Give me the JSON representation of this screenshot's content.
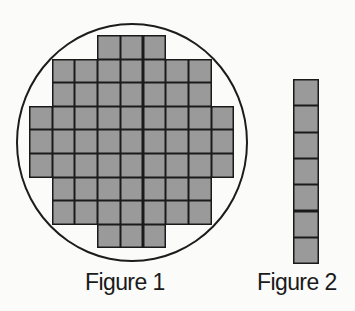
{
  "figure1": {
    "caption": "Figure 1",
    "shape": "circle",
    "grid": {
      "origin_x": 29,
      "origin_y": 35,
      "cell_w": 22.7,
      "cell_h": 23.6,
      "rows": [
        {
          "start_col": 3,
          "count": 3
        },
        {
          "start_col": 1,
          "count": 7
        },
        {
          "start_col": 1,
          "count": 7
        },
        {
          "start_col": 0,
          "count": 9
        },
        {
          "start_col": 0,
          "count": 9
        },
        {
          "start_col": 0,
          "count": 9
        },
        {
          "start_col": 1,
          "count": 7
        },
        {
          "start_col": 1,
          "count": 7
        },
        {
          "start_col": 3,
          "count": 3
        }
      ],
      "total_squares": 57
    }
  },
  "figure2": {
    "caption": "Figure 2",
    "column": {
      "origin_x": 293,
      "origin_y": 79,
      "cell_w": 26,
      "cell_h": 26.3,
      "count": 7
    }
  },
  "colors": {
    "fill": "#9a9a9a",
    "line": "#1a1a1a",
    "background": "#fbfbfa"
  }
}
